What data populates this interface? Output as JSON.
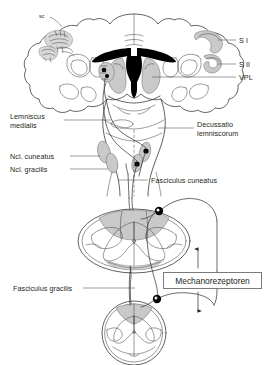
{
  "diagram": {
    "title_visible": false,
    "labels": {
      "sc": "sc",
      "s1": "S I",
      "s2": "S II",
      "vpl": "VPL",
      "lemniscus_medialis": "Lemniscus\nmedialis",
      "decussatio": "Decussatio\nlemniscorum",
      "ncl_cuneatus": "Ncl. cuneatus",
      "ncl_gracilis": "Ncl. gracilis",
      "fasciculus_cuneatus": "Fasciculus cuneatus",
      "fasciculus_gracilis": "Fasciculus gracilis",
      "mechanorezeptoren": "Mechanorezeptoren"
    },
    "colors": {
      "ink": "#231f20",
      "outline": "#3a3a3a",
      "gray_fill": "#c9c9c9",
      "gray_fill_light": "#d8d8d8",
      "black_fill": "#000000",
      "box_border": "#7a7a7a",
      "leader": "#3a3a3a"
    },
    "structures": [
      {
        "name": "cerebral-coronal-section",
        "region": "top",
        "fills": [
          "cortex-gray-bands",
          "black-ventricles",
          "thalamus-gray"
        ]
      },
      {
        "name": "brainstem-medulla",
        "region": "middle",
        "fills": [
          "nucleus-gray-ellipses",
          "synapse-dots"
        ]
      },
      {
        "name": "spinal-cord-cervical",
        "region": "lower",
        "fills": [
          "dorsal-column-gray"
        ]
      },
      {
        "name": "spinal-cord-lumbar",
        "region": "bottom",
        "fills": [
          "dorsal-column-gray"
        ]
      }
    ],
    "pathway": {
      "name": "dorsal-column-medial-lemniscus",
      "arrows": [
        "up-arrow-above-box",
        "down-arrow-below-box"
      ],
      "ganglia": 2
    }
  }
}
